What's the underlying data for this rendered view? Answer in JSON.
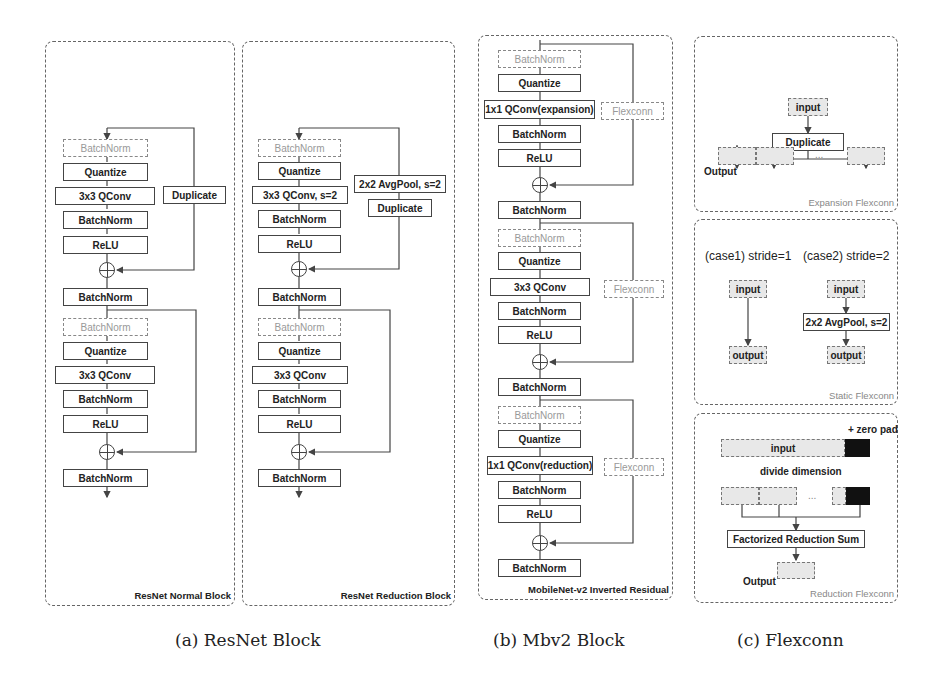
{
  "figure": {
    "captions": {
      "a": "(a) ResNet Block",
      "b": "(b) Mbv2 Block",
      "c": "(c) Flexconn"
    }
  },
  "resnet_normal": {
    "title": "ResNet Normal Block",
    "stage1": [
      "BatchNorm",
      "Quantize",
      "3x3 QConv",
      "BatchNorm",
      "ReLU"
    ],
    "shortcut1": "Duplicate",
    "mid_norm": "BatchNorm",
    "stage2": [
      "BatchNorm",
      "Quantize",
      "3x3 QConv",
      "BatchNorm",
      "ReLU"
    ],
    "out_norm": "BatchNorm"
  },
  "resnet_reduction": {
    "title": "ResNet Reduction Block",
    "stage1": [
      "BatchNorm",
      "Quantize",
      "3x3 QConv, s=2",
      "BatchNorm",
      "ReLU"
    ],
    "shortcut1": [
      "2x2 AvgPool, s=2",
      "Duplicate"
    ],
    "mid_norm": "BatchNorm",
    "stage2": [
      "BatchNorm",
      "Quantize",
      "3x3 QConv",
      "BatchNorm",
      "ReLU"
    ],
    "out_norm": "BatchNorm"
  },
  "mbv2": {
    "title": "MobileNet-v2 Inverted Residual",
    "stage1": [
      "BatchNorm",
      "Quantize",
      "1x1 QConv(expansion)",
      "BatchNorm",
      "ReLU"
    ],
    "stage2": [
      "BatchNorm",
      "Quantize",
      "3x3 QConv",
      "BatchNorm",
      "ReLU"
    ],
    "stage3": [
      "BatchNorm",
      "Quantize",
      "1x1 QConv(reduction)",
      "BatchNorm",
      "ReLU"
    ],
    "norms": [
      "BatchNorm",
      "BatchNorm",
      "BatchNorm"
    ],
    "flexconn": "Flexconn"
  },
  "expansion_flexconn": {
    "title": "Expansion Flexconn",
    "input": "input",
    "duplicate": "Duplicate",
    "ellipsis": "...",
    "output": "Output"
  },
  "static_flexconn": {
    "title": "Static Flexconn",
    "case1": "(case1) stride=1",
    "case2": "(case2) stride=2",
    "input": "input",
    "output": "output",
    "pool": "2x2 AvgPool, s=2"
  },
  "reduction_flexconn": {
    "title": "Reduction Flexconn",
    "zero_pad": "+ zero pad",
    "input": "input",
    "divide": "divide dimension",
    "ellipsis": "...",
    "sum": "Factorized Reduction Sum",
    "output": "Output"
  }
}
